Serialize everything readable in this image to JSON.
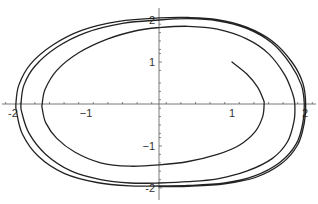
{
  "chart_data": {
    "type": "line",
    "title": "",
    "xlabel": "",
    "ylabel": "",
    "xlim": [
      -2.1,
      2.15
    ],
    "ylim": [
      -2.05,
      2.05
    ],
    "grid": false,
    "legend": null,
    "x_ticks": [
      {
        "value": -2,
        "label": "-2"
      },
      {
        "value": -1,
        "label": "−1"
      },
      {
        "value": 1,
        "label": "1"
      },
      {
        "value": 2,
        "label": "2"
      }
    ],
    "y_ticks": [
      {
        "value": 2,
        "label": "2"
      },
      {
        "value": 1,
        "label": "1"
      },
      {
        "value": -1,
        "label": "−1"
      },
      {
        "value": -2,
        "label": "-2"
      }
    ],
    "minor_tick_step": 0.2,
    "series": [
      {
        "name": "trajectory",
        "start_point": [
          1.0,
          1.0
        ],
        "limit_cycle": {
          "x_max": 2.0,
          "x_min": -1.95,
          "y_max": 2.05,
          "y_min": -1.95
        },
        "points": [
          [
            1.0,
            1.0
          ],
          [
            1.2,
            0.72
          ],
          [
            1.35,
            0.4
          ],
          [
            1.43,
            0.1
          ],
          [
            1.44,
            0.0
          ],
          [
            1.42,
            -0.3
          ],
          [
            1.32,
            -0.65
          ],
          [
            1.1,
            -0.98
          ],
          [
            0.8,
            -1.2
          ],
          [
            0.4,
            -1.37
          ],
          [
            0.0,
            -1.45
          ],
          [
            -0.4,
            -1.48
          ],
          [
            -0.8,
            -1.4
          ],
          [
            -1.15,
            -1.15
          ],
          [
            -1.4,
            -0.82
          ],
          [
            -1.55,
            -0.45
          ],
          [
            -1.6,
            -0.1
          ],
          [
            -1.6,
            0.0
          ],
          [
            -1.56,
            0.35
          ],
          [
            -1.4,
            0.8
          ],
          [
            -1.1,
            1.22
          ],
          [
            -0.7,
            1.55
          ],
          [
            -0.3,
            1.75
          ],
          [
            0.0,
            1.82
          ],
          [
            0.4,
            1.85
          ],
          [
            0.8,
            1.78
          ],
          [
            1.2,
            1.55
          ],
          [
            1.5,
            1.2
          ],
          [
            1.72,
            0.7
          ],
          [
            1.83,
            0.25
          ],
          [
            1.86,
            0.0
          ],
          [
            1.85,
            -0.4
          ],
          [
            1.76,
            -0.9
          ],
          [
            1.55,
            -1.3
          ],
          [
            1.2,
            -1.6
          ],
          [
            0.8,
            -1.78
          ],
          [
            0.4,
            -1.85
          ],
          [
            0.0,
            -1.88
          ],
          [
            -0.4,
            -1.88
          ],
          [
            -0.8,
            -1.8
          ],
          [
            -1.2,
            -1.6
          ],
          [
            -1.55,
            -1.2
          ],
          [
            -1.78,
            -0.7
          ],
          [
            -1.88,
            -0.2
          ],
          [
            -1.89,
            0.0
          ],
          [
            -1.85,
            0.45
          ],
          [
            -1.7,
            0.9
          ],
          [
            -1.4,
            1.35
          ],
          [
            -1.0,
            1.7
          ],
          [
            -0.5,
            1.92
          ],
          [
            0.0,
            2.0
          ],
          [
            0.4,
            2.03
          ],
          [
            0.8,
            1.98
          ],
          [
            1.2,
            1.8
          ],
          [
            1.55,
            1.45
          ],
          [
            1.8,
            0.95
          ],
          [
            1.95,
            0.45
          ],
          [
            1.99,
            0.0
          ],
          [
            1.97,
            -0.45
          ],
          [
            1.88,
            -0.95
          ],
          [
            1.65,
            -1.4
          ],
          [
            1.3,
            -1.72
          ],
          [
            0.9,
            -1.88
          ],
          [
            0.4,
            -1.94
          ],
          [
            0.0,
            -1.95
          ],
          [
            -0.4,
            -1.95
          ],
          [
            -0.85,
            -1.87
          ],
          [
            -1.3,
            -1.65
          ],
          [
            -1.65,
            -1.25
          ],
          [
            -1.87,
            -0.72
          ],
          [
            -1.95,
            -0.2
          ],
          [
            -1.96,
            0.0
          ],
          [
            -1.92,
            0.45
          ],
          [
            -1.76,
            0.95
          ],
          [
            -1.46,
            1.4
          ],
          [
            -1.05,
            1.76
          ],
          [
            -0.55,
            1.97
          ],
          [
            0.0,
            2.05
          ],
          [
            0.4,
            2.06
          ],
          [
            0.8,
            2.01
          ],
          [
            1.2,
            1.83
          ],
          [
            1.55,
            1.5
          ],
          [
            1.82,
            1.0
          ],
          [
            1.97,
            0.5
          ],
          [
            2.01,
            0.0
          ],
          [
            1.99,
            -0.45
          ],
          [
            1.9,
            -0.97
          ],
          [
            1.67,
            -1.43
          ],
          [
            1.32,
            -1.75
          ],
          [
            0.9,
            -1.9
          ],
          [
            0.4,
            -1.96
          ],
          [
            0.0,
            -1.97
          ]
        ]
      }
    ]
  },
  "colors": {
    "curve": "#222222",
    "axis": "#555555",
    "background": "#ffffff"
  },
  "layout_px": {
    "origin": [
      159,
      104
    ],
    "x_unit": 73,
    "y_unit": -42
  }
}
